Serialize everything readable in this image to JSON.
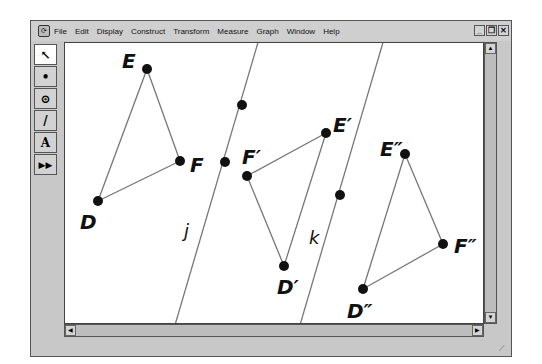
{
  "menubar": {
    "items": [
      "File",
      "Edit",
      "Display",
      "Construct",
      "Transform",
      "Measure",
      "Graph",
      "Window",
      "Help"
    ]
  },
  "window_controls": {
    "minimize": "_",
    "restore": "❐",
    "close": "✕"
  },
  "toolbox": {
    "tools": [
      {
        "name": "arrow-tool",
        "glyph": "↖"
      },
      {
        "name": "point-tool",
        "glyph": "•"
      },
      {
        "name": "compass-tool",
        "glyph": "⊙"
      },
      {
        "name": "straightedge-tool",
        "glyph": "/"
      },
      {
        "name": "text-tool",
        "glyph": "A"
      },
      {
        "name": "custom-tool",
        "glyph": "▶▶"
      }
    ]
  },
  "canvas": {
    "lines": [
      {
        "label": "j"
      },
      {
        "label": "k"
      }
    ],
    "triangles": [
      {
        "vertices": [
          "D",
          "E",
          "F"
        ]
      },
      {
        "vertices": [
          "D′",
          "E′",
          "F′"
        ]
      },
      {
        "vertices": [
          "D″",
          "E″",
          "F″"
        ]
      }
    ],
    "labels": {
      "E": "E",
      "F": "F",
      "D": "D",
      "E1": "E′",
      "F1": "F′",
      "D1": "D′",
      "E2": "E″",
      "F2": "F″",
      "D2": "D″",
      "j": "j",
      "k": "k"
    }
  },
  "scrollbars": {
    "up": "▲",
    "down": "▼",
    "left": "◀",
    "right": "▶"
  }
}
